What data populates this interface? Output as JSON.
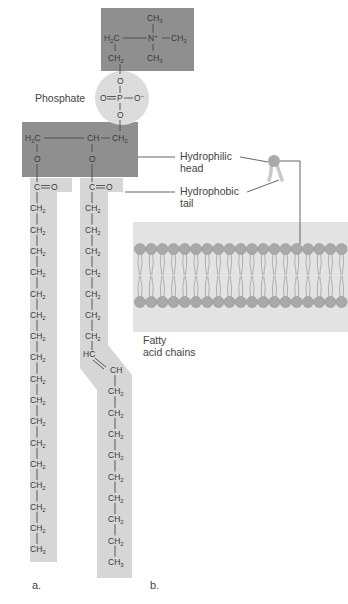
{
  "figure": {
    "panels": [
      "a.",
      "b."
    ],
    "choline_group": {
      "labels": [
        "CH3",
        "H2C",
        "N+",
        "CH3",
        "CH3",
        "CH2"
      ],
      "color": "#8f8f8f"
    },
    "phosphate": {
      "label": "Phosphate",
      "atoms": [
        "O",
        "O",
        "P",
        "O−",
        "O"
      ],
      "color": "#d9d9d9"
    },
    "glycerol": {
      "atoms": [
        "H2C",
        "CH",
        "CH2",
        "O",
        "O"
      ],
      "color": "#8f8f8f"
    },
    "chain_a": {
      "carbonyl": "C=O",
      "ch2_count": 16,
      "terminal": "CH3",
      "color": "#d6d6d6"
    },
    "chain_b": {
      "carbonyl": "C=O",
      "ch2_before_double_bond": 7,
      "double_bond": [
        "HC",
        "CH"
      ],
      "ch2_after_double_bond": 8,
      "terminal": "CH3",
      "color": "#d6d6d6"
    },
    "callouts": {
      "hydrophilic": [
        "Hydrophilic",
        "head"
      ],
      "hydrophobic": [
        "Hydrophobic",
        "tail"
      ],
      "fatty": [
        "Fatty",
        "acid chains"
      ]
    },
    "bilayer": {
      "bg_color": "#e3e3e3",
      "head_color": "#a9a9a9",
      "heads_per_row": 19
    }
  }
}
